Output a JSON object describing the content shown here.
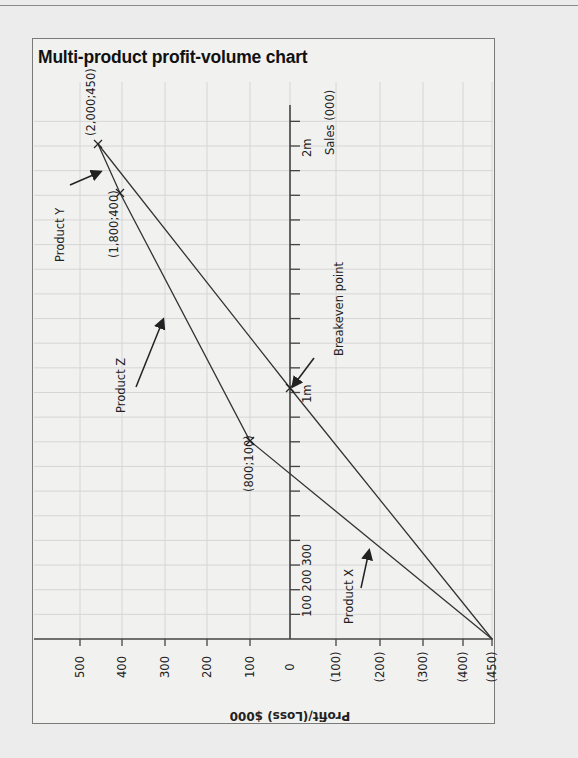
{
  "title": "Multi-product profit-volume chart",
  "chart_data": {
    "type": "line",
    "title": "Multi-product profit-volume chart",
    "orientation": "rotated 90° (sales axis vertical, profit axis horizontal, labels rotated)",
    "xlabel": "Profit/(Loss) $000",
    "ylabel": "Sales (000)",
    "profit_ticks": [
      {
        "value": 500,
        "label": "500",
        "x": 80
      },
      {
        "value": 400,
        "label": "400",
        "x": 122
      },
      {
        "value": 300,
        "label": "300",
        "x": 165
      },
      {
        "value": 200,
        "label": "200",
        "x": 207
      },
      {
        "value": 100,
        "label": "100",
        "x": 250
      },
      {
        "value": 0,
        "label": "0",
        "x": 290
      },
      {
        "value": -100,
        "label": "(100)",
        "x": 336
      },
      {
        "value": -200,
        "label": "(200)",
        "x": 380
      },
      {
        "value": -300,
        "label": "(300)",
        "x": 423
      },
      {
        "value": -400,
        "label": "(400)",
        "x": 463
      },
      {
        "value": -450,
        "label": "(450)",
        "x": 492
      }
    ],
    "sales_tick_labels": [
      {
        "value": 100,
        "label": "100"
      },
      {
        "value": 200,
        "label": "200"
      },
      {
        "value": 300,
        "label": "300"
      },
      {
        "value": 1000,
        "label": "1m"
      },
      {
        "value": 2000,
        "label": "2m"
      }
    ],
    "sales_tick_step": 100,
    "sales_range": [
      0,
      2150
    ],
    "profit_range": [
      -450,
      500
    ],
    "grid": true,
    "series": [
      {
        "name": "Cumulative line (Product X → Y via breakeven)",
        "points": [
          {
            "sales": 0,
            "profit": -450
          },
          {
            "sales": 1000,
            "profit": 0
          },
          {
            "sales": 2000,
            "profit": 450
          }
        ]
      },
      {
        "name": "Product-by-product line (X → Z → Y)",
        "points": [
          {
            "sales": 0,
            "profit": -450
          },
          {
            "sales": 800,
            "profit": 100
          },
          {
            "sales": 1800,
            "profit": 400
          },
          {
            "sales": 2000,
            "profit": 450
          }
        ]
      }
    ],
    "annotations": [
      {
        "text": "(2,000;450)",
        "sales": 2000,
        "profit": 450
      },
      {
        "text": "(1,800;400)",
        "sales": 1800,
        "profit": 400
      },
      {
        "text": "(800;100)",
        "sales": 800,
        "profit": 100
      },
      {
        "text": "Breakeven point",
        "sales": 1000,
        "profit": 0
      },
      {
        "text": "Product X"
      },
      {
        "text": "Product Y"
      },
      {
        "text": "Product Z"
      }
    ]
  },
  "labels": {
    "point_2000": "(2,000;450)",
    "point_1800": "(1,800;400)",
    "point_800": "(800;100)",
    "breakeven": "Breakeven point",
    "product_x": "Product X",
    "product_y": "Product Y",
    "product_z": "Product Z",
    "tick_1m": "1m",
    "tick_2m": "2m",
    "sales_axis": "Sales (000)",
    "sales_small": "100 200 300",
    "profit_axis": "Profit/(Loss) $000",
    "profit_tick_labels": [
      "500",
      "400",
      "300",
      "200",
      "100",
      "0",
      "(100)",
      "(200)",
      "(300)",
      "(400)",
      "(450)"
    ]
  },
  "colors": {
    "line": "#333333",
    "grid": "#d6d6d6",
    "axis": "#444444",
    "text": "#222222"
  }
}
